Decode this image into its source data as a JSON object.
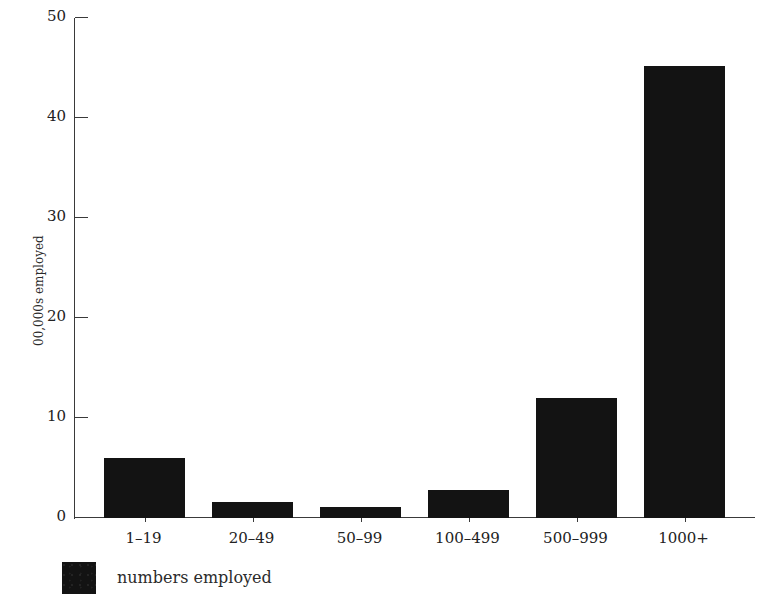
{
  "chart_data": {
    "type": "bar",
    "title": "",
    "subtitle": "",
    "xlabel": "",
    "ylabel": "00,000s employed",
    "categories": [
      "1–19",
      "20–49",
      "50–99",
      "100–499",
      "500–999",
      "1000+"
    ],
    "values": [
      6,
      1.6,
      1.1,
      2.8,
      12,
      45.2
    ],
    "series": [
      {
        "name": "numbers employed",
        "values": [
          6,
          1.6,
          1.1,
          2.8,
          12,
          45.2
        ]
      }
    ],
    "ylim": [
      0,
      50
    ],
    "yticks": [
      0,
      10,
      20,
      30,
      40,
      50
    ],
    "ytick_labels": [
      "0",
      "10",
      "20",
      "30",
      "40",
      "50"
    ],
    "grid": false,
    "legend_position": "bottom-left",
    "legend": [
      {
        "label": "numbers employed",
        "color": "#131313"
      }
    ],
    "bar_color": "#131313",
    "axis_color": "#3a3a3a",
    "background_color": "#ffffff"
  },
  "figure": {
    "y_axis_title": "00,000s employed",
    "legend_entry_label": "numbers employed"
  }
}
